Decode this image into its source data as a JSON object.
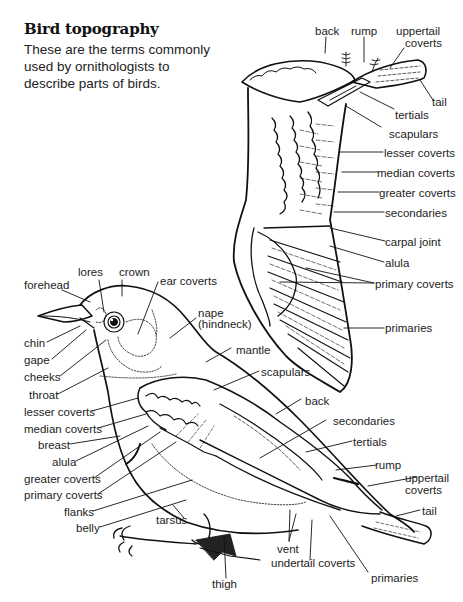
{
  "title": "Bird topography",
  "intro": "These are the terms commonly used by ornithologists to describe parts of birds.",
  "wing_labels": {
    "back": "back",
    "rump": "rump",
    "uppertail_coverts_1": "uppertail",
    "uppertail_coverts_2": "coverts",
    "tail": "tail",
    "tertials": "tertials",
    "scapulars": "scapulars",
    "lesser_coverts": "lesser coverts",
    "median_coverts": "median coverts",
    "greater_coverts": "greater coverts",
    "secondaries": "secondaries",
    "carpal_joint": "carpal joint",
    "alula": "alula",
    "primary_coverts": "primary coverts",
    "primaries": "primaries"
  },
  "body_labels": {
    "forehead": "forehead",
    "lores": "lores",
    "crown": "crown",
    "ear_coverts": "ear coverts",
    "nape_1": "nape",
    "nape_2": "(hindneck)",
    "chin": "chin",
    "gape": "gape",
    "cheeks": "cheeks",
    "throat": "throat",
    "lesser_coverts": "lesser coverts",
    "median_coverts": "median coverts",
    "breast": "breast",
    "alula": "alula",
    "greater_coverts": "greater coverts",
    "primary_coverts": "primary coverts",
    "flanks": "flanks",
    "belly": "belly",
    "tarsus": "tarsus",
    "mantle": "mantle",
    "scapulars": "scapulars",
    "back": "back",
    "secondaries": "secondaries",
    "tertials": "tertials",
    "rump": "rump",
    "uppertail_coverts_1": "uppertail",
    "uppertail_coverts_2": "coverts",
    "tail": "tail",
    "vent": "vent",
    "undertail_coverts": "undertail coverts",
    "thigh": "thigh",
    "primaries": "primaries"
  },
  "colors": {
    "ink": "#111111",
    "background": "#ffffff"
  }
}
